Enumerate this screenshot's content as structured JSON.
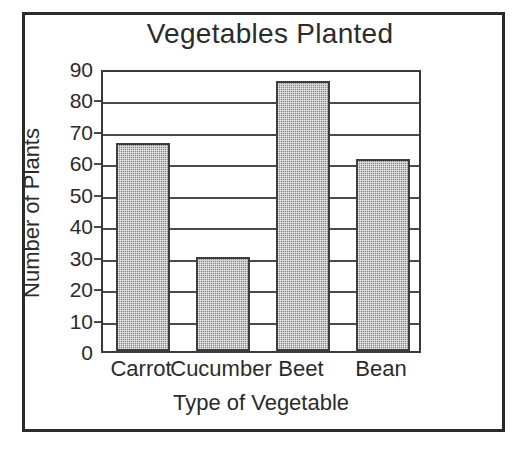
{
  "chart_data": {
    "type": "bar",
    "title": "Vegetables Planted",
    "xlabel": "Type of Vegetable",
    "ylabel": "Number of Plants",
    "categories": [
      "Carrot",
      "Cucumber",
      "Beet",
      "Bean"
    ],
    "values": [
      66,
      30,
      86,
      61
    ],
    "ylim": [
      0,
      90
    ],
    "ytick_labels": [
      "90",
      "80",
      "70",
      "60",
      "50",
      "40",
      "30",
      "20",
      "10",
      "0"
    ],
    "ytick_values": [
      90,
      80,
      70,
      60,
      50,
      40,
      30,
      20,
      10,
      0
    ],
    "ystep": 10,
    "grid": "horizontal",
    "legend": "none",
    "bar_fill": "#8a8a8a",
    "bar_edge": "#3d3d3d",
    "axis_color": "#3a3a3a",
    "text_color": "#2b2b2b",
    "background": "#ffffff"
  }
}
